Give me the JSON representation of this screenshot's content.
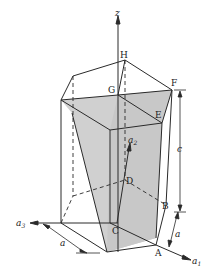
{
  "diagram": {
    "type": "crystal-unit-cell",
    "vertex_labels": {
      "A": "A",
      "B": "B",
      "C": "C",
      "D": "D",
      "E": "E",
      "F": "F",
      "G": "G",
      "H": "H"
    },
    "axis_labels": {
      "z": "z",
      "a1": "a",
      "a1_sub": "1",
      "a2": "a",
      "a2_sub": "2",
      "a3": "a",
      "a3_sub": "3"
    },
    "dimension_labels": {
      "height": "c",
      "edge_right": "a",
      "edge_left": "a"
    },
    "colors": {
      "line": "#2a2a2a",
      "shade": "#cfcfcf",
      "background": "#ffffff"
    }
  }
}
